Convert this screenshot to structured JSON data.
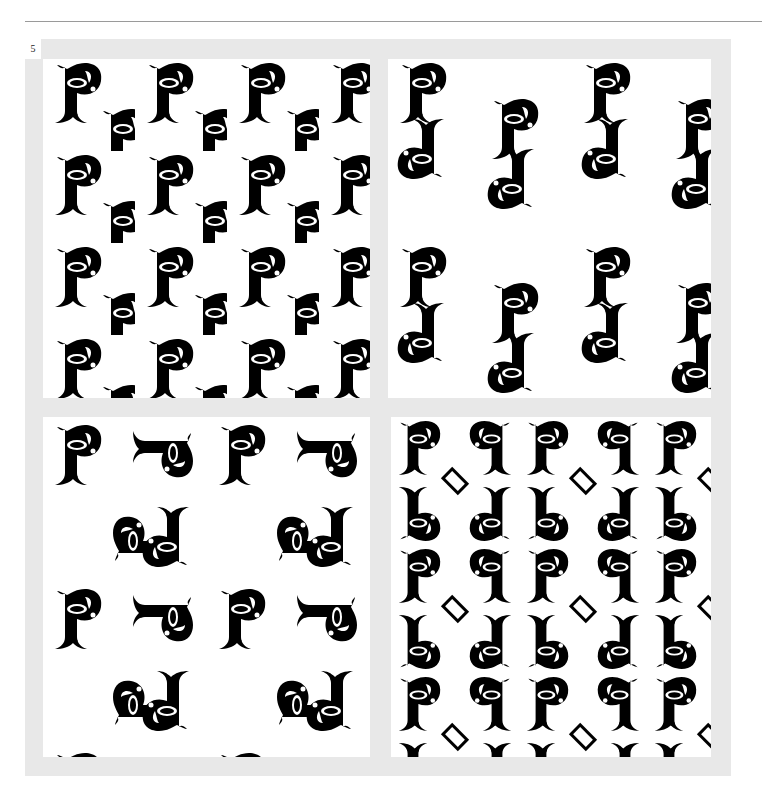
{
  "page": {
    "number": "5"
  },
  "panels": [
    {
      "id": "top-left",
      "label": "Translated P pattern"
    },
    {
      "id": "top-right",
      "label": "Alternating P and rotated P pattern"
    },
    {
      "id": "bottom-left",
      "label": "Rotated P pattern with quarter turns"
    },
    {
      "id": "bottom-right",
      "label": "Interlocking mirrored P pattern"
    }
  ],
  "colors": {
    "frame": "#e8e8e8",
    "ink": "#000000",
    "paper": "#ffffff",
    "rule": "#9a9a9a"
  }
}
